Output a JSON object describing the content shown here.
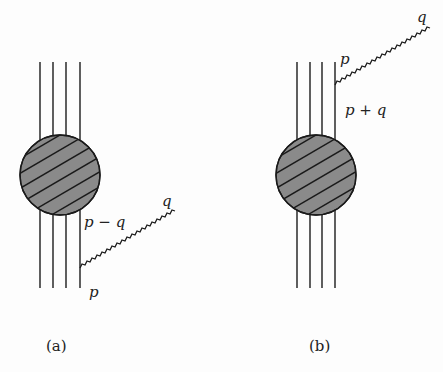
{
  "figure": {
    "panels": [
      {
        "caption": "(a)",
        "labels": {
          "outgoing_photon": "q",
          "internal_line": "p − q",
          "incoming_line": "p"
        }
      },
      {
        "caption": "(b)",
        "labels": {
          "outgoing_photon": "q",
          "outgoing_line": "p",
          "internal_line": "p + q"
        }
      }
    ],
    "colors": {
      "blob_fill": "#8a8a8a",
      "ink": "#1a1a1a",
      "background": "#fdfdfd"
    }
  }
}
